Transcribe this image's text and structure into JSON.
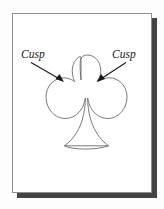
{
  "figure": {
    "background_color": "#fdfdfd",
    "card": {
      "fill_color": "#ffffff",
      "border_color": "#8e8e8e",
      "shadow_color": "#444444"
    },
    "labels": [
      {
        "id": "cusp-left",
        "text": "Cusp",
        "style": "italic-serif",
        "color": "#1a1a1a"
      },
      {
        "id": "cusp-right",
        "text": "Cusp",
        "style": "italic-serif",
        "color": "#1a1a1a"
      }
    ],
    "shape": {
      "name": "club",
      "stroke_color": "#6b6b6b",
      "fill_color": "none",
      "description": "Three-lobed club outline with flared stem and base bar"
    },
    "annotations": [
      {
        "id": "arrow-left",
        "from_label": "Cusp",
        "points_to": "left cusp",
        "color": "#1a1a1a"
      },
      {
        "id": "arrow-right",
        "from_label": "Cusp",
        "points_to": "right cusp",
        "color": "#1a1a1a"
      }
    ]
  }
}
